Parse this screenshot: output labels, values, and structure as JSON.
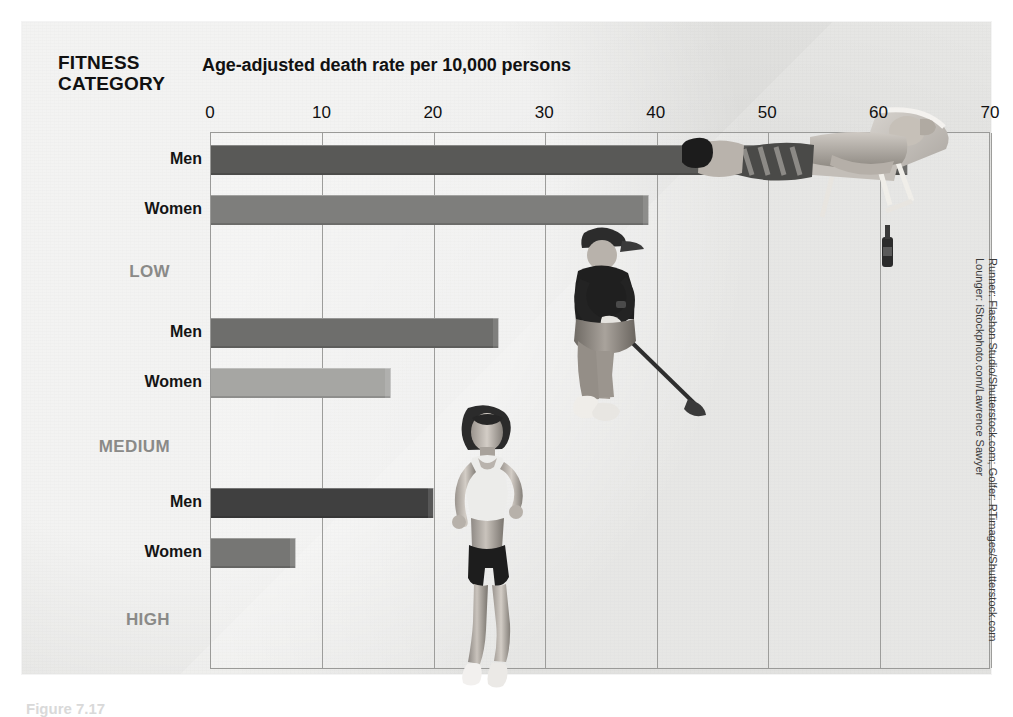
{
  "header": {
    "category_heading_line1": "FITNESS",
    "category_heading_line2": "CATEGORY",
    "axis_title": "Age-adjusted death rate per 10,000 persons"
  },
  "credit": {
    "line1": "Runner: Flashon Studio/Shutterstock.com; Golfer: RTimages/Shutterstock.com",
    "line2": "Lounger: iStockphoto.com/Lawrence Sawyer"
  },
  "caption": {
    "text": "Figure 7.17"
  },
  "photos": [
    {
      "name": "runner-photo",
      "subject": "female runner"
    },
    {
      "name": "golfer-photo",
      "subject": "male golfer swinging club"
    },
    {
      "name": "lounger-photo",
      "subject": "man reclining on lounge chair with bottle"
    }
  ],
  "chart_data": {
    "type": "bar",
    "orientation": "horizontal",
    "title": "Age-adjusted death rate per 10,000 persons",
    "xlabel": "Age-adjusted death rate per 10,000 persons",
    "ylabel": "FITNESS CATEGORY",
    "xlim": [
      0,
      70
    ],
    "xticks": [
      0,
      10,
      20,
      30,
      40,
      50,
      60,
      70
    ],
    "grid": true,
    "legend": "none",
    "groups": [
      {
        "category": "LOW",
        "color_label": "#8a8a88",
        "bars": [
          {
            "series": "Men",
            "value": 62.5,
            "color": "#595957"
          },
          {
            "series": "Women",
            "value": 39.2,
            "color": "#7e7e7c"
          }
        ]
      },
      {
        "category": "MEDIUM",
        "color_label": "#8a8a88",
        "bars": [
          {
            "series": "Men",
            "value": 25.8,
            "color": "#6e6e6c"
          },
          {
            "series": "Women",
            "value": 16.1,
            "color": "#a6a6a3"
          }
        ]
      },
      {
        "category": "HIGH",
        "color_label": "#8a8a88",
        "bars": [
          {
            "series": "Men",
            "value": 19.9,
            "color": "#404040"
          },
          {
            "series": "Women",
            "value": 7.5,
            "color": "#767674"
          }
        ]
      }
    ]
  }
}
